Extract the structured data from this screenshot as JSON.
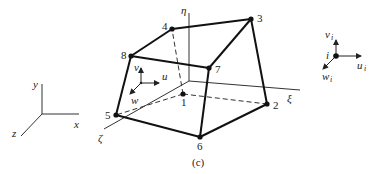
{
  "figure": {
    "caption": "(c)",
    "element": {
      "nodes": [
        {
          "id": "1",
          "label": "1",
          "x": 183,
          "y": 94,
          "hidden": true
        },
        {
          "id": "2",
          "label": "2",
          "x": 267,
          "y": 104
        },
        {
          "id": "3",
          "label": "3",
          "x": 251,
          "y": 19
        },
        {
          "id": "4",
          "label": "4",
          "x": 172,
          "y": 29
        },
        {
          "id": "5",
          "label": "5",
          "x": 116,
          "y": 115
        },
        {
          "id": "6",
          "label": "6",
          "x": 200,
          "y": 137
        },
        {
          "id": "7",
          "label": "7",
          "x": 209,
          "y": 68
        },
        {
          "id": "8",
          "label": "8",
          "x": 131,
          "y": 56
        }
      ],
      "natural_axes": {
        "eta": "η",
        "xi": "ξ",
        "zeta": "ζ"
      },
      "local_displacements": {
        "u": "u",
        "v": "v",
        "w": "w"
      }
    },
    "global_axes": {
      "x": "x",
      "y": "y",
      "z": "z"
    },
    "nodal_dof_legend": {
      "node": "i",
      "u": "u",
      "v": "v",
      "w": "w",
      "subscript": "i"
    }
  }
}
